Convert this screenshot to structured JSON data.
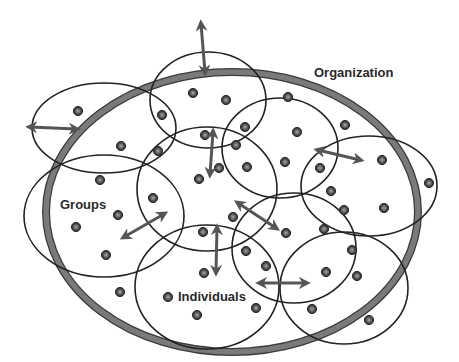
{
  "labels": {
    "organization": "Organization",
    "groups": "Groups",
    "individuals": "Individuals"
  },
  "colors": {
    "background": "#ffffff",
    "organization_ring": "#7a7a7a",
    "organization_ring_edge": "#3a3a3a",
    "group_outline": "#222222",
    "arrow": "#555555",
    "dot_outer": "#2b2b2b",
    "dot_inner": "#9a9a9a",
    "label": "#2a2a2a"
  },
  "organization": {
    "cx": 232,
    "cy": 212,
    "rx": 186,
    "ry": 140
  },
  "groups": [
    {
      "cx": 104,
      "cy": 128,
      "rx": 72,
      "ry": 45
    },
    {
      "cx": 208,
      "cy": 100,
      "rx": 58,
      "ry": 48
    },
    {
      "cx": 280,
      "cy": 148,
      "rx": 58,
      "ry": 50
    },
    {
      "cx": 207,
      "cy": 189,
      "rx": 70,
      "ry": 62
    },
    {
      "cx": 104,
      "cy": 216,
      "rx": 80,
      "ry": 61
    },
    {
      "cx": 369,
      "cy": 186,
      "rx": 68,
      "ry": 50
    },
    {
      "cx": 294,
      "cy": 248,
      "rx": 62,
      "ry": 55
    },
    {
      "cx": 207,
      "cy": 287,
      "rx": 72,
      "ry": 62
    },
    {
      "cx": 344,
      "cy": 288,
      "rx": 64,
      "ry": 56
    }
  ],
  "individuals": [
    [
      78,
      111
    ],
    [
      121,
      146
    ],
    [
      162,
      115
    ],
    [
      158,
      151
    ],
    [
      193,
      93
    ],
    [
      226,
      100
    ],
    [
      245,
      127
    ],
    [
      288,
      97
    ],
    [
      205,
      135
    ],
    [
      236,
      145
    ],
    [
      297,
      132
    ],
    [
      345,
      125
    ],
    [
      199,
      179
    ],
    [
      219,
      168
    ],
    [
      247,
      167
    ],
    [
      285,
      162
    ],
    [
      320,
      168
    ],
    [
      382,
      160
    ],
    [
      429,
      183
    ],
    [
      331,
      191
    ],
    [
      344,
      210
    ],
    [
      384,
      208
    ],
    [
      100,
      180
    ],
    [
      118,
      215
    ],
    [
      153,
      198
    ],
    [
      76,
      227
    ],
    [
      106,
      255
    ],
    [
      233,
      217
    ],
    [
      286,
      233
    ],
    [
      324,
      229
    ],
    [
      246,
      251
    ],
    [
      266,
      266
    ],
    [
      352,
      250
    ],
    [
      326,
      272
    ],
    [
      357,
      276
    ],
    [
      203,
      232
    ],
    [
      204,
      273
    ],
    [
      168,
      297
    ],
    [
      120,
      292
    ],
    [
      197,
      315
    ],
    [
      256,
      308
    ],
    [
      312,
      309
    ],
    [
      369,
      320
    ]
  ],
  "arrows": [
    {
      "x1": 201,
      "y1": 24,
      "x2": 205,
      "y2": 72
    },
    {
      "x1": 30,
      "y1": 127,
      "x2": 76,
      "y2": 129
    },
    {
      "x1": 213,
      "y1": 132,
      "x2": 210,
      "y2": 174
    },
    {
      "x1": 318,
      "y1": 150,
      "x2": 360,
      "y2": 160
    },
    {
      "x1": 124,
      "y1": 237,
      "x2": 164,
      "y2": 214
    },
    {
      "x1": 238,
      "y1": 203,
      "x2": 276,
      "y2": 228
    },
    {
      "x1": 217,
      "y1": 228,
      "x2": 216,
      "y2": 272
    },
    {
      "x1": 260,
      "y1": 283,
      "x2": 306,
      "y2": 283
    }
  ],
  "label_positions": {
    "organization": {
      "x": 314,
      "y": 66
    },
    "groups": {
      "x": 60,
      "y": 198
    },
    "individuals": {
      "x": 178,
      "y": 290
    }
  }
}
